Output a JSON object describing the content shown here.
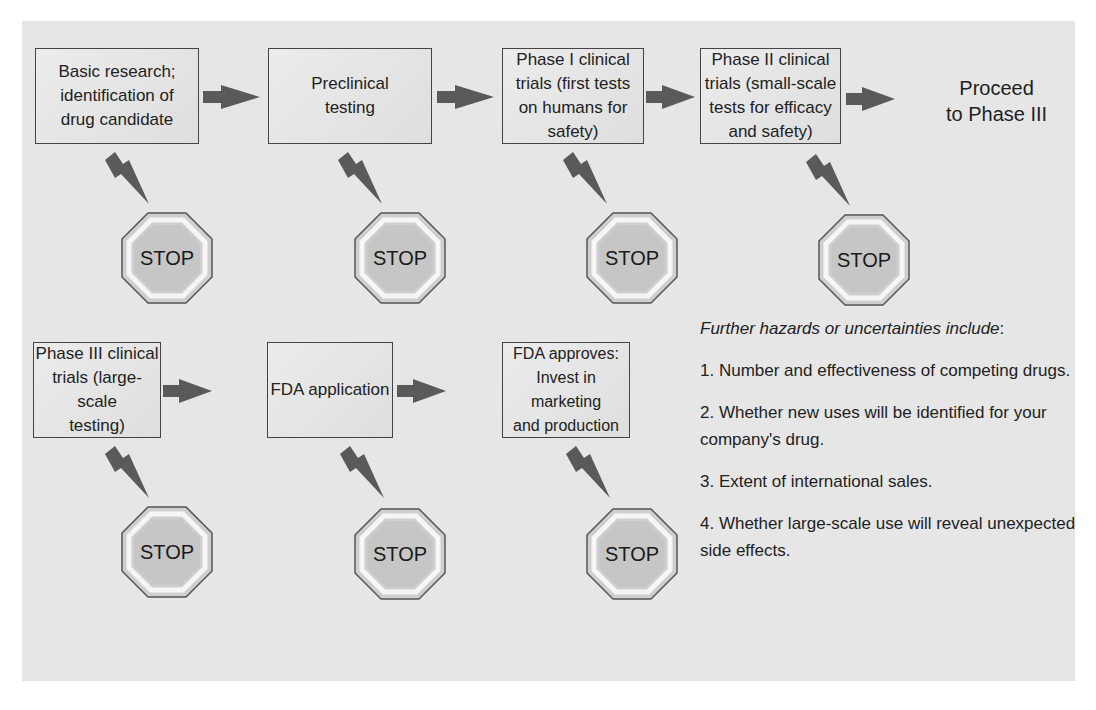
{
  "diagram": {
    "row1": [
      {
        "id": "basic-research",
        "label": "Basic research;\nidentification of\ndrug candidate"
      },
      {
        "id": "preclinical",
        "label": "Preclinical\ntesting"
      },
      {
        "id": "phase-1",
        "label": "Phase I clinical\ntrials (first tests\non humans for\nsafety)"
      },
      {
        "id": "phase-2",
        "label": "Phase II clinical\ntrials (small-scale\ntests for efficacy\nand safety)"
      }
    ],
    "proceed_label": "Proceed\nto Phase III",
    "row2": [
      {
        "id": "phase-3",
        "label": "Phase III clinical\ntrials (large-scale\ntesting)"
      },
      {
        "id": "fda-application",
        "label": "FDA application"
      },
      {
        "id": "fda-approves",
        "label": "FDA approves:\nInvest in marketing\nand production"
      }
    ],
    "stop_label": "STOP",
    "stop_signs": [
      "STOP",
      "STOP",
      "STOP",
      "STOP",
      "STOP",
      "STOP",
      "STOP"
    ],
    "colors": {
      "background": "#e6e6e6",
      "box_fill": "#e4e4e4",
      "arrow": "#5a5a5a",
      "stop_fill": "#c8c8c8",
      "stop_ring": "#f4f4f4",
      "border": "#444444"
    }
  },
  "notes": {
    "heading": "Further hazards or uncertainties include",
    "heading_suffix": ":",
    "items": [
      "1. Number and effectiveness of competing drugs.",
      "2. Whether new uses will be identified for your company's drug.",
      "3. Extent of international sales.",
      "4. Whether large-scale use will reveal unexpected side effects."
    ]
  }
}
